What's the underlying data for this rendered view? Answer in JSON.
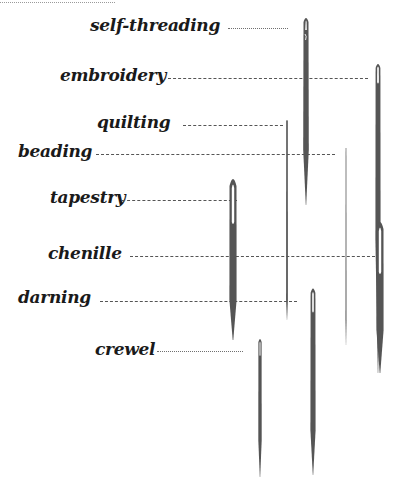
{
  "needles": [
    {
      "id": "self-threading",
      "label": "self-threading",
      "line": "dotted"
    },
    {
      "id": "embroidery",
      "label": "embroidery",
      "line": "dashed"
    },
    {
      "id": "quilting",
      "label": "quilting",
      "line": "dashed"
    },
    {
      "id": "beading",
      "label": "beading",
      "line": "dashed"
    },
    {
      "id": "tapestry",
      "label": "tapestry",
      "line": "dashed"
    },
    {
      "id": "chenille",
      "label": "chenille",
      "line": "dashed"
    },
    {
      "id": "darning",
      "label": "darning",
      "line": "dashed"
    },
    {
      "id": "crewel",
      "label": "crewel",
      "line": "dotted"
    }
  ],
  "colors": {
    "needle": "#555555",
    "label": "#1a1a1a",
    "background": "#ffffff"
  }
}
